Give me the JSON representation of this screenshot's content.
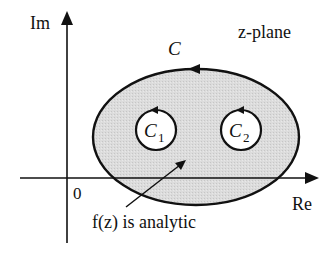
{
  "diagram": {
    "axes": {
      "imaginary_label": "Im",
      "real_label": "Re",
      "origin_label": "0"
    },
    "plane_label": "z-plane",
    "outer_contour": {
      "label": "C",
      "fill": "#d9d9d9",
      "stroke": "#111111"
    },
    "inner_contours": [
      {
        "label": "C",
        "subscript": "1"
      },
      {
        "label": "C",
        "subscript": "2"
      }
    ],
    "annotation": "f(z) is analytic"
  }
}
